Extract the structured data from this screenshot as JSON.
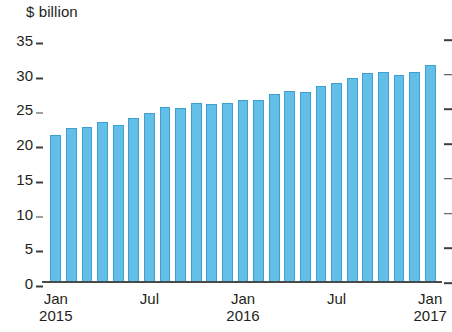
{
  "chart_data": {
    "type": "bar",
    "title": "$ billion",
    "xlabel": "",
    "ylabel": "$ billion",
    "ylim": [
      0,
      35
    ],
    "ytick_values": [
      35,
      30,
      25,
      20,
      15,
      10,
      5,
      0
    ],
    "ytick_labels": [
      "35",
      "30",
      "25",
      "20",
      "15",
      "10",
      "5",
      "0"
    ],
    "grid": false,
    "legend": null,
    "bar_color": "#62c0e8",
    "bar_edge_color": "#3f9fce",
    "axis_color": "#4a4a4a",
    "x_axis_ticks": [
      {
        "month": "Jan",
        "year": "2015",
        "index": 0
      },
      {
        "month": "Jul",
        "year": "",
        "index": 6
      },
      {
        "month": "Jan",
        "year": "2016",
        "index": 12
      },
      {
        "month": "Jul",
        "year": "",
        "index": 18
      },
      {
        "month": "Jan",
        "year": "2017",
        "index": 24
      }
    ],
    "categories": [
      "Jan 2015",
      "Feb 2015",
      "Mar 2015",
      "Apr 2015",
      "May 2015",
      "Jun 2015",
      "Jul 2015",
      "Aug 2015",
      "Sep 2015",
      "Oct 2015",
      "Nov 2015",
      "Dec 2015",
      "Jan 2016",
      "Feb 2016",
      "Mar 2016",
      "Apr 2016",
      "May 2016",
      "Jun 2016",
      "Jul 2016",
      "Aug 2016",
      "Sep 2016",
      "Oct 2016",
      "Nov 2016",
      "Dec 2016",
      "Jan 2017"
    ],
    "values": [
      21.3,
      22.3,
      22.5,
      23.2,
      22.8,
      23.8,
      24.5,
      25.3,
      25.2,
      26.0,
      25.8,
      25.9,
      26.4,
      26.3,
      27.2,
      27.6,
      27.5,
      28.4,
      28.8,
      29.5,
      30.2,
      30.4,
      29.9,
      30.4,
      31.4
    ]
  }
}
